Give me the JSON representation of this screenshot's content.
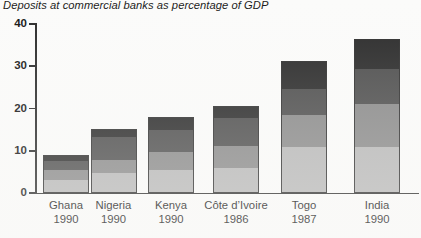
{
  "chart_data": {
    "type": "bar",
    "title": "Deposits at commercial banks as percentage of GDP",
    "xlabel": "",
    "ylabel": "",
    "ylim": [
      0,
      40
    ],
    "yticks": [
      0,
      10,
      20,
      30,
      40
    ],
    "ytick_labels": [
      "0",
      "10",
      "20",
      "30",
      "40"
    ],
    "grid": false,
    "legend": "none",
    "stacked": true,
    "categories": [
      {
        "name": "Ghana",
        "year": "1990"
      },
      {
        "name": "Nigeria",
        "year": "1990"
      },
      {
        "name": "Kenya",
        "year": "1990"
      },
      {
        "name": "Côte d’Ivoire",
        "year": "1986"
      },
      {
        "name": "Togo",
        "year": "1987"
      },
      {
        "name": "India",
        "year": "1990"
      }
    ],
    "category_labels": [
      "Ghana",
      "Nigeria",
      "Kenya",
      "Côte d’Ivoire",
      "Togo",
      "India"
    ],
    "category_years": [
      "1990",
      "1990",
      "1990",
      "1986",
      "1987",
      "1990"
    ],
    "series": [
      {
        "name": "segment-1-bottom",
        "color": "#b8b8b8",
        "values": [
          3.1,
          4.8,
          5.5,
          5.9,
          11.0,
          11.0
        ]
      },
      {
        "name": "segment-2",
        "color": "#8a8a8a",
        "values": [
          2.4,
          3.1,
          4.3,
          5.2,
          7.4,
          10.0
        ]
      },
      {
        "name": "segment-3",
        "color": "#4e4e4e",
        "values": [
          2.0,
          5.3,
          5.0,
          6.6,
          6.2,
          8.3
        ]
      },
      {
        "name": "segment-4-top",
        "color": "#2b2b2b",
        "values": [
          1.6,
          1.9,
          3.3,
          3.0,
          6.7,
          7.2
        ]
      }
    ],
    "totals": [
      9.1,
      15.1,
      18.1,
      20.7,
      31.3,
      36.5
    ],
    "units": "percentage of GDP"
  },
  "axis": {
    "y_labels": [
      "40",
      "30",
      "20",
      "10",
      "0"
    ]
  }
}
